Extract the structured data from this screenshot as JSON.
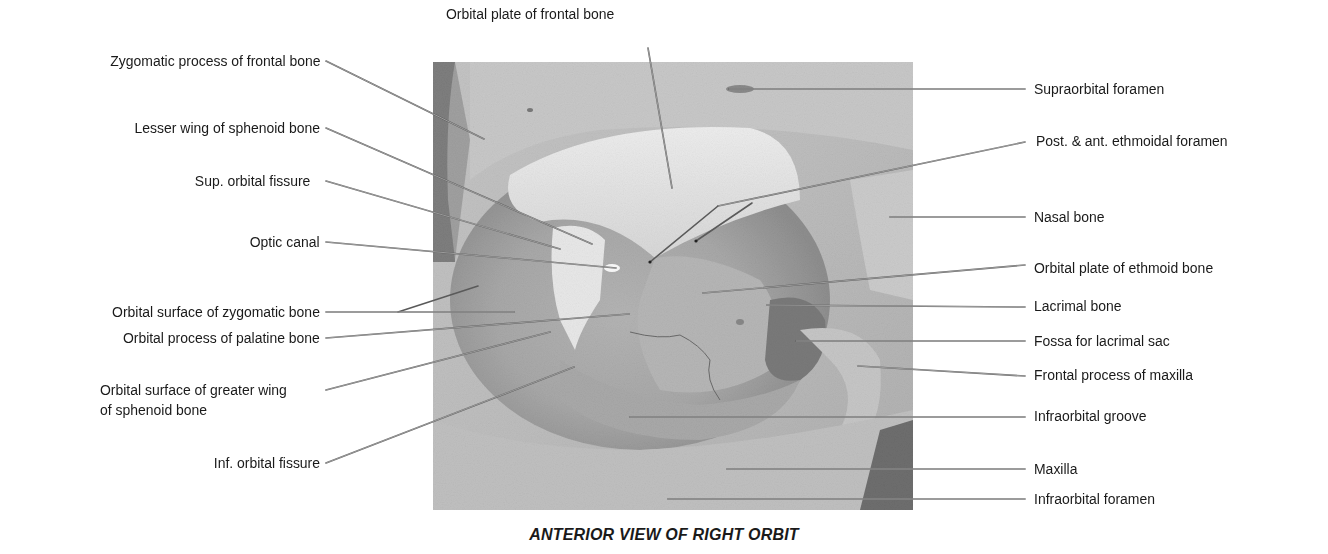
{
  "figure": {
    "caption": "ANTERIOR VIEW OF RIGHT ORBIT",
    "photo": {
      "x": 433,
      "y": 62,
      "width": 480,
      "height": 448,
      "tone": "grayscale"
    },
    "colors": {
      "text": "#1a1a1a",
      "leader_line": "#555555",
      "background": "#ffffff"
    }
  },
  "labels": {
    "top": [
      {
        "text": "Orbital plate of frontal bone"
      }
    ],
    "left": [
      {
        "text": "Zygomatic process of frontal bone"
      },
      {
        "text": "Lesser wing of sphenoid bone"
      },
      {
        "text": "Sup. orbital fissure"
      },
      {
        "text": "Optic canal"
      },
      {
        "text": "Orbital surface of zygomatic bone"
      },
      {
        "text": "Orbital process of palatine bone"
      },
      {
        "text": "Orbital surface of greater wing"
      },
      {
        "text": "of sphenoid bone"
      },
      {
        "text": "Inf. orbital fissure"
      }
    ],
    "right": [
      {
        "text": "Supraorbital foramen"
      },
      {
        "text": "Post. & ant. ethmoidal foramen"
      },
      {
        "text": "Nasal bone"
      },
      {
        "text": "Orbital plate of ethmoid bone"
      },
      {
        "text": "Lacrimal bone"
      },
      {
        "text": "Fossa for lacrimal sac"
      },
      {
        "text": "Frontal process of maxilla"
      },
      {
        "text": "Infraorbital groove"
      },
      {
        "text": "Maxilla"
      },
      {
        "text": "Infraorbital foramen"
      }
    ]
  }
}
